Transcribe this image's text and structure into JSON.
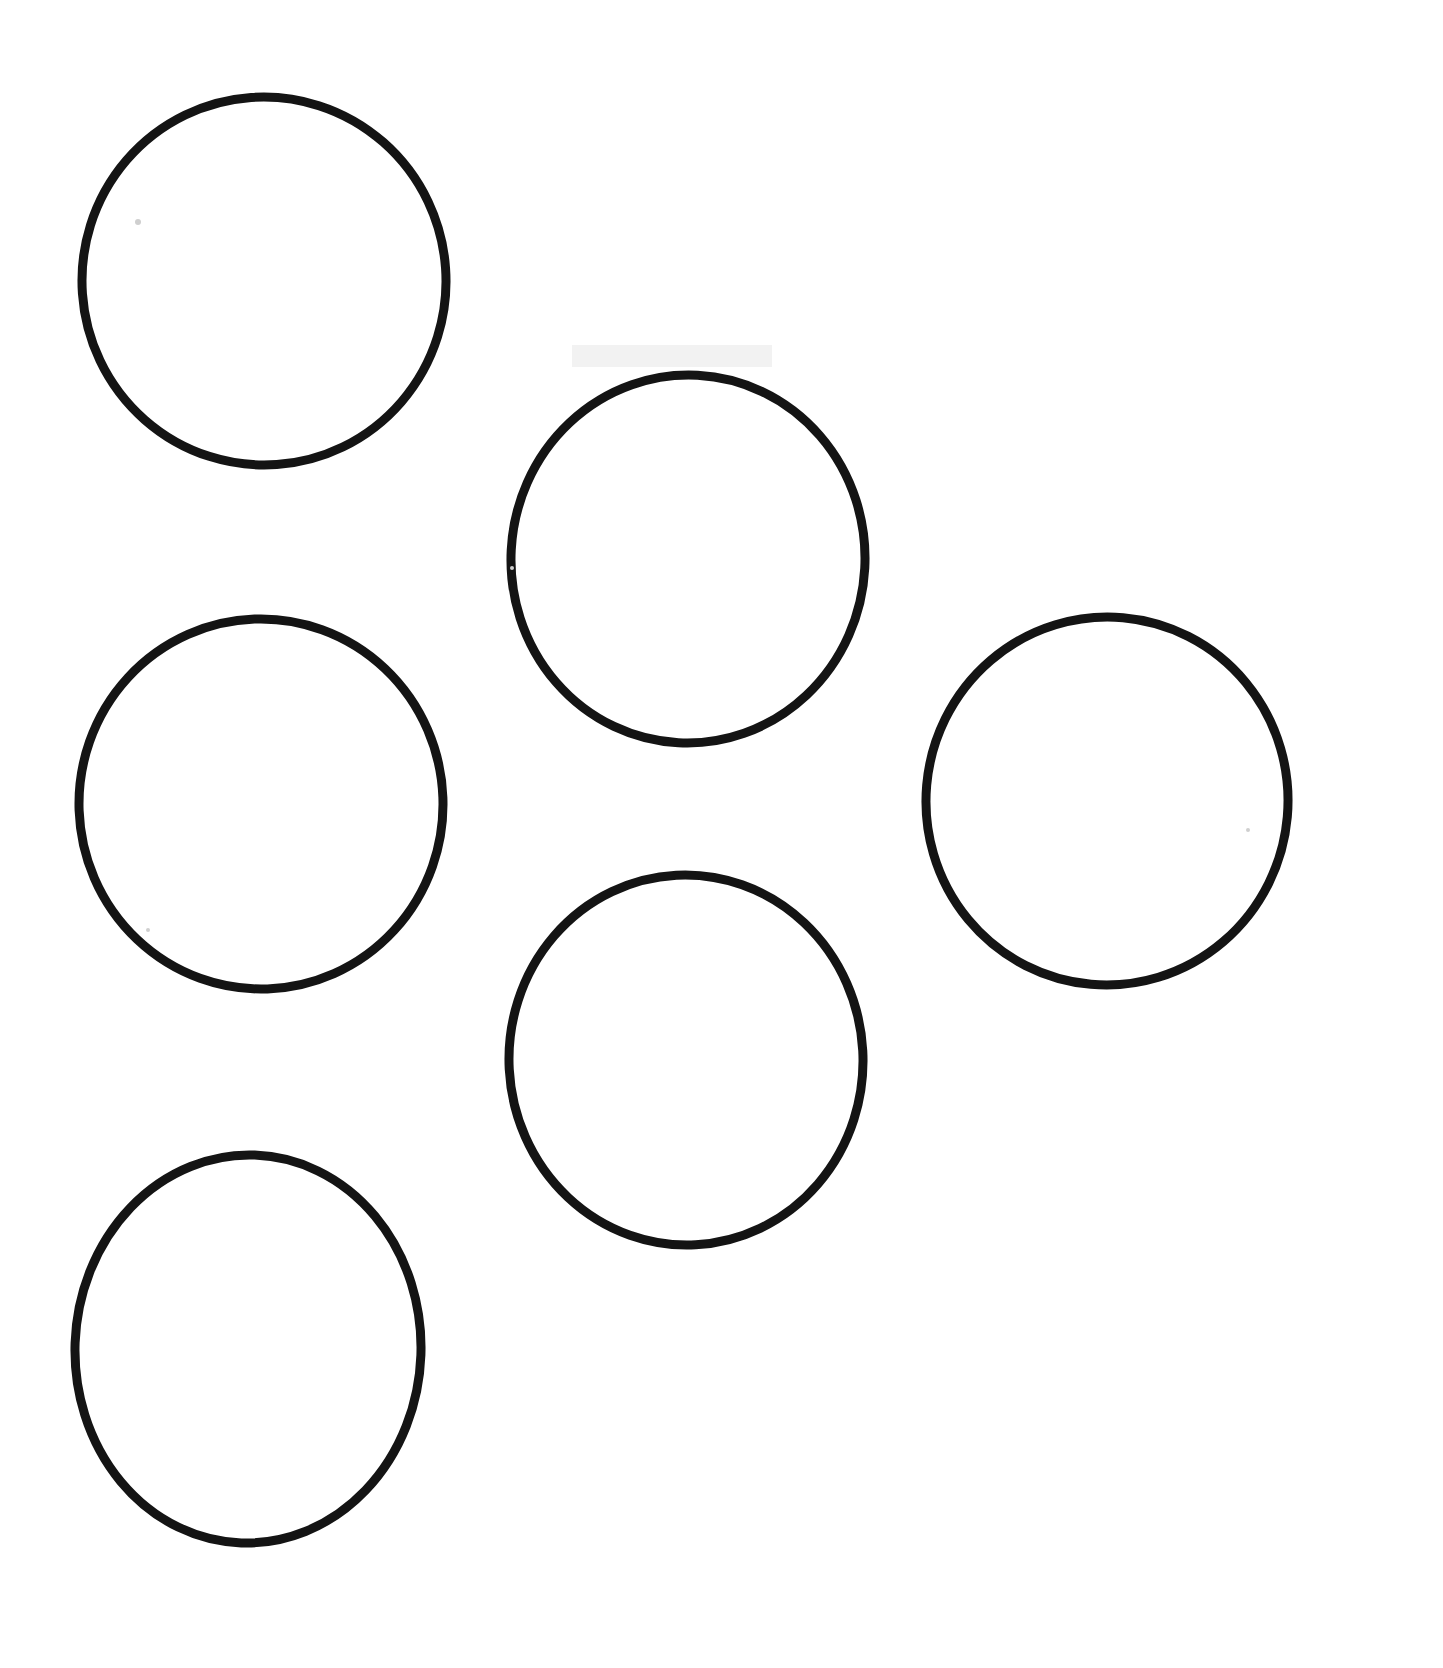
{
  "page": {
    "background_color": "#ffffff",
    "width": 1443,
    "height": 1668
  },
  "style": {
    "stroke_color": "#141414",
    "fill_color": "none",
    "stroke_width": 9,
    "speck_color": "#cfcfcf",
    "smudge_color": "#f2f2f2"
  },
  "chart_data": {
    "type": "scatter",
    "title": "",
    "xlabel": "",
    "ylabel": "",
    "xlim": [
      0,
      1443
    ],
    "ylim": [
      0,
      1668
    ],
    "grid": false,
    "legend": "none",
    "shape": "circle-outline",
    "count": 6,
    "categories": [
      "circle-top-left",
      "circle-top-middle",
      "circle-middle-left",
      "circle-right",
      "circle-bottom-middle",
      "circle-bottom-left"
    ],
    "points": [
      {
        "name": "circle-top-left",
        "cx": 264,
        "cy": 281,
        "rx": 182,
        "ry": 184,
        "rotation": -4
      },
      {
        "name": "circle-top-middle",
        "cx": 688,
        "cy": 559,
        "rx": 177,
        "ry": 184,
        "rotation": 3
      },
      {
        "name": "circle-middle-left",
        "cx": 261,
        "cy": 804,
        "rx": 182,
        "ry": 185,
        "rotation": -2
      },
      {
        "name": "circle-right",
        "cx": 1107,
        "cy": 801,
        "rx": 181,
        "ry": 184,
        "rotation": 5
      },
      {
        "name": "circle-bottom-middle",
        "cx": 686,
        "cy": 1060,
        "rx": 177,
        "ry": 185,
        "rotation": -3
      },
      {
        "name": "circle-bottom-left",
        "cx": 248,
        "cy": 1349,
        "rx": 173,
        "ry": 194,
        "rotation": 2
      }
    ]
  },
  "marks": {
    "specks": [
      {
        "name": "speck-upper-left-inside-circle-1",
        "cx": 138,
        "cy": 222,
        "r": 3
      },
      {
        "name": "speck-left-of-circle-2",
        "cx": 512,
        "cy": 568,
        "r": 2
      },
      {
        "name": "speck-inside-circle-3",
        "cx": 148,
        "cy": 930,
        "r": 2
      },
      {
        "name": "speck-inside-circle-4",
        "cx": 1248,
        "cy": 830,
        "r": 2
      }
    ],
    "smudges": [
      {
        "name": "smudge-above-circle-2",
        "x": 572,
        "y": 345,
        "width": 200,
        "height": 22
      }
    ]
  }
}
